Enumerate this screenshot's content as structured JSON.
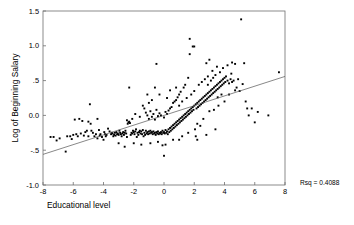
{
  "chart_data": {
    "type": "scatter",
    "title": "",
    "xlabel": "Educational level",
    "ylabel": "Log of Beginning Salary",
    "xlim": [
      -8,
      8
    ],
    "ylim": [
      -1.0,
      1.5
    ],
    "xticks": [
      -8,
      -6,
      -4,
      -2,
      0,
      2,
      4,
      6,
      8
    ],
    "xticklabels": [
      "-8",
      "-6",
      "-4",
      "-2",
      "0",
      "2",
      "4",
      "6",
      "8"
    ],
    "yticks": [
      -1.0,
      -0.5,
      0.0,
      0.5,
      1.0,
      1.5
    ],
    "yticklabels": [
      "-1.0",
      "-.5",
      "0.0",
      ".5",
      "1.0",
      "1.5"
    ],
    "grid": false,
    "legend": null,
    "marker_color": "#000000",
    "marker_size": 1.9,
    "frame_color": "#6f6f6f",
    "annotations": [
      {
        "name": "rsq-annotation",
        "text": "Rsq = 0.4088",
        "x_px": 300,
        "y_px": 185
      }
    ],
    "fit_line": {
      "name": "regression-line",
      "type": "linear",
      "slope": 0.07,
      "intercept": 0.0,
      "x_start": -8,
      "y_start": -0.56,
      "x_end": 8,
      "y_end": 0.56,
      "color": "#555555",
      "width": 0.7
    },
    "points": [
      [
        -7.5,
        -0.31
      ],
      [
        -7.3,
        -0.31
      ],
      [
        -7.1,
        -0.36
      ],
      [
        -6.9,
        -0.33
      ],
      [
        -6.5,
        -0.52
      ],
      [
        -6.4,
        -0.3
      ],
      [
        -6.2,
        -0.3
      ],
      [
        -6.1,
        -0.34
      ],
      [
        -5.9,
        -0.06
      ],
      [
        -5.8,
        -0.27
      ],
      [
        -5.7,
        -0.3
      ],
      [
        -5.6,
        -0.05
      ],
      [
        -5.5,
        -0.26
      ],
      [
        -5.4,
        -0.08
      ],
      [
        -5.3,
        -0.29
      ],
      [
        -5.2,
        -0.24
      ],
      [
        -5.1,
        -0.22
      ],
      [
        -5.0,
        -0.09
      ],
      [
        -4.9,
        0.16
      ],
      [
        -4.85,
        -0.12
      ],
      [
        -4.8,
        -0.22
      ],
      [
        -4.7,
        -0.25
      ],
      [
        -4.6,
        -0.3
      ],
      [
        -4.5,
        -0.27
      ],
      [
        -4.4,
        -0.33
      ],
      [
        -4.3,
        -0.21
      ],
      [
        -4.25,
        -0.29
      ],
      [
        -4.2,
        -0.27
      ],
      [
        -4.1,
        -0.31
      ],
      [
        -4.0,
        -0.35
      ],
      [
        -3.95,
        -0.24
      ],
      [
        -3.9,
        -0.27
      ],
      [
        -3.85,
        -0.3
      ],
      [
        -3.8,
        -0.28
      ],
      [
        -3.7,
        -0.19
      ],
      [
        -3.6,
        -0.23
      ],
      [
        -3.5,
        -0.27
      ],
      [
        -3.45,
        -0.25
      ],
      [
        -3.4,
        -0.26
      ],
      [
        -3.35,
        -0.3
      ],
      [
        -3.3,
        -0.28
      ],
      [
        -3.25,
        -0.25
      ],
      [
        -3.2,
        -0.29
      ],
      [
        -3.15,
        -0.24
      ],
      [
        -3.1,
        -0.27
      ],
      [
        -3.05,
        -0.26
      ],
      [
        -3.0,
        -0.28
      ],
      [
        -2.95,
        -0.22
      ],
      [
        -2.9,
        -0.25
      ],
      [
        -2.85,
        -0.27
      ],
      [
        -2.8,
        -0.3
      ],
      [
        -2.75,
        -0.26
      ],
      [
        -2.7,
        -0.24
      ],
      [
        -2.65,
        -0.28
      ],
      [
        -2.6,
        -0.25
      ],
      [
        -2.55,
        -0.22
      ],
      [
        -2.5,
        -0.26
      ],
      [
        -2.45,
        -0.31
      ],
      [
        -2.4,
        -0.12
      ],
      [
        -2.35,
        -0.1
      ],
      [
        -2.3,
        -0.09
      ],
      [
        -2.25,
        -0.11
      ],
      [
        -2.2,
        -0.28
      ],
      [
        -2.15,
        -0.25
      ],
      [
        -2.1,
        -0.26
      ],
      [
        -2.05,
        -0.22
      ],
      [
        -2.0,
        -0.24
      ],
      [
        -2.0,
        -0.4
      ],
      [
        -1.95,
        -0.27
      ],
      [
        -1.9,
        -0.23
      ],
      [
        -1.85,
        -0.2
      ],
      [
        -1.8,
        -0.31
      ],
      [
        -1.75,
        -0.25
      ],
      [
        -1.7,
        -0.28
      ],
      [
        -1.65,
        -0.24
      ],
      [
        -1.6,
        -0.22
      ],
      [
        -1.55,
        -0.26
      ],
      [
        -1.5,
        -0.23
      ],
      [
        -1.45,
        -0.27
      ],
      [
        -1.4,
        -0.21
      ],
      [
        -1.35,
        -0.3
      ],
      [
        -1.3,
        -0.25
      ],
      [
        -1.3,
        0.1
      ],
      [
        -1.25,
        -0.28
      ],
      [
        -1.2,
        -0.22
      ],
      [
        -1.2,
        0.04
      ],
      [
        -1.15,
        -0.26
      ],
      [
        -1.1,
        -0.24
      ],
      [
        -1.1,
        0.0
      ],
      [
        -1.05,
        -0.27
      ],
      [
        -1.0,
        -0.23
      ],
      [
        -1.0,
        -0.05
      ],
      [
        -1.0,
        0.18
      ],
      [
        -0.95,
        -0.26
      ],
      [
        -0.9,
        -0.22
      ],
      [
        -0.9,
        0.06
      ],
      [
        -0.85,
        -0.25
      ],
      [
        -0.8,
        -0.24
      ],
      [
        -0.8,
        -0.02
      ],
      [
        -0.75,
        -0.27
      ],
      [
        -0.7,
        -0.23
      ],
      [
        -0.7,
        0.02
      ],
      [
        -0.65,
        -0.26
      ],
      [
        -0.6,
        -0.25
      ],
      [
        -0.6,
        -0.06
      ],
      [
        -0.55,
        -0.28
      ],
      [
        -0.5,
        -0.24
      ],
      [
        -0.5,
        0.08
      ],
      [
        -0.45,
        -0.26
      ],
      [
        -0.4,
        -0.23
      ],
      [
        -0.4,
        -0.01
      ],
      [
        -0.35,
        -0.27
      ],
      [
        -0.3,
        -0.25
      ],
      [
        -0.3,
        0.03
      ],
      [
        -0.25,
        -0.26
      ],
      [
        -0.2,
        -0.24
      ],
      [
        -0.2,
        0.0
      ],
      [
        -0.15,
        -0.27
      ],
      [
        -0.1,
        -0.22
      ],
      [
        -0.1,
        -0.43
      ],
      [
        -0.05,
        -0.25
      ],
      [
        0.0,
        -0.24
      ],
      [
        0.0,
        -0.03
      ],
      [
        0.0,
        -0.58
      ],
      [
        0.05,
        -0.26
      ],
      [
        0.1,
        -0.21
      ],
      [
        0.1,
        0.05
      ],
      [
        0.15,
        -0.25
      ],
      [
        0.2,
        -0.23
      ],
      [
        0.2,
        0.02
      ],
      [
        0.25,
        -0.27
      ],
      [
        0.3,
        -0.2
      ],
      [
        0.3,
        0.07
      ],
      [
        0.35,
        -0.24
      ],
      [
        0.4,
        -0.18
      ],
      [
        0.4,
        0.1
      ],
      [
        0.45,
        -0.22
      ],
      [
        0.5,
        -0.16
      ],
      [
        0.5,
        0.12
      ],
      [
        0.55,
        -0.2
      ],
      [
        0.6,
        -0.14
      ],
      [
        0.6,
        0.18
      ],
      [
        0.65,
        -0.18
      ],
      [
        0.7,
        -0.12
      ],
      [
        0.7,
        0.2
      ],
      [
        0.75,
        -0.16
      ],
      [
        0.8,
        -0.1
      ],
      [
        0.8,
        0.22
      ],
      [
        0.85,
        -0.14
      ],
      [
        0.9,
        -0.08
      ],
      [
        0.9,
        0.26
      ],
      [
        0.95,
        -0.12
      ],
      [
        1.0,
        -0.06
      ],
      [
        1.0,
        0.14
      ],
      [
        1.0,
        0.3
      ],
      [
        1.05,
        -0.1
      ],
      [
        1.1,
        -0.04
      ],
      [
        1.1,
        0.34
      ],
      [
        1.15,
        -0.08
      ],
      [
        1.2,
        -0.02
      ],
      [
        1.2,
        0.2
      ],
      [
        1.25,
        -0.06
      ],
      [
        1.3,
        0.0
      ],
      [
        1.3,
        0.4
      ],
      [
        1.35,
        -0.04
      ],
      [
        1.4,
        0.02
      ],
      [
        1.4,
        0.44
      ],
      [
        1.45,
        -0.02
      ],
      [
        1.5,
        0.04
      ],
      [
        1.5,
        0.25
      ],
      [
        1.55,
        0.0
      ],
      [
        1.6,
        0.06
      ],
      [
        1.6,
        0.54
      ],
      [
        1.65,
        0.02
      ],
      [
        1.7,
        0.08
      ],
      [
        1.7,
        0.88
      ],
      [
        1.7,
        1.1
      ],
      [
        1.75,
        0.04
      ],
      [
        1.8,
        0.1
      ],
      [
        1.8,
        0.3
      ],
      [
        1.85,
        0.06
      ],
      [
        1.9,
        0.12
      ],
      [
        1.9,
        0.99
      ],
      [
        1.95,
        0.08
      ],
      [
        2.0,
        0.14
      ],
      [
        2.0,
        0.35
      ],
      [
        2.0,
        0.99
      ],
      [
        2.05,
        -0.2
      ],
      [
        2.1,
        0.16
      ],
      [
        2.1,
        -0.3
      ],
      [
        2.15,
        0.1
      ],
      [
        2.2,
        0.18
      ],
      [
        2.2,
        -0.12
      ],
      [
        2.25,
        0.12
      ],
      [
        2.3,
        0.2
      ],
      [
        2.3,
        0.44
      ],
      [
        2.35,
        0.14
      ],
      [
        2.4,
        0.22
      ],
      [
        2.4,
        -0.15
      ],
      [
        2.45,
        0.16
      ],
      [
        2.5,
        0.24
      ],
      [
        2.5,
        0.48
      ],
      [
        2.55,
        0.18
      ],
      [
        2.6,
        0.26
      ],
      [
        2.6,
        -0.05
      ],
      [
        2.65,
        0.2
      ],
      [
        2.7,
        0.28
      ],
      [
        2.7,
        0.52
      ],
      [
        2.75,
        0.22
      ],
      [
        2.8,
        0.3
      ],
      [
        2.8,
        0.75
      ],
      [
        2.85,
        0.24
      ],
      [
        2.9,
        0.32
      ],
      [
        2.9,
        0.56
      ],
      [
        2.95,
        0.26
      ],
      [
        3.0,
        0.34
      ],
      [
        3.0,
        0.06
      ],
      [
        3.0,
        0.8
      ],
      [
        3.05,
        0.28
      ],
      [
        3.1,
        0.36
      ],
      [
        3.1,
        0.5
      ],
      [
        3.15,
        0.3
      ],
      [
        3.2,
        0.38
      ],
      [
        3.2,
        0.64
      ],
      [
        3.25,
        0.32
      ],
      [
        3.3,
        0.4
      ],
      [
        3.3,
        0.08
      ],
      [
        3.35,
        0.34
      ],
      [
        3.4,
        0.42
      ],
      [
        3.4,
        0.58
      ],
      [
        3.45,
        0.36
      ],
      [
        3.5,
        0.44
      ],
      [
        3.5,
        0.7
      ],
      [
        3.55,
        0.38
      ],
      [
        3.6,
        0.46
      ],
      [
        3.6,
        0.14
      ],
      [
        3.65,
        0.4
      ],
      [
        3.7,
        0.48
      ],
      [
        3.7,
        0.62
      ],
      [
        3.75,
        0.42
      ],
      [
        3.8,
        0.5
      ],
      [
        3.8,
        0.3
      ],
      [
        3.85,
        0.44
      ],
      [
        3.9,
        0.52
      ],
      [
        3.9,
        0.68
      ],
      [
        3.95,
        0.46
      ],
      [
        4.0,
        0.54
      ],
      [
        4.0,
        0.2
      ],
      [
        4.05,
        0.48
      ],
      [
        4.1,
        0.56
      ],
      [
        4.2,
        0.5
      ],
      [
        4.2,
        0.72
      ],
      [
        4.3,
        0.46
      ],
      [
        4.3,
        0.3
      ],
      [
        4.4,
        0.52
      ],
      [
        4.5,
        0.48
      ],
      [
        4.5,
        0.76
      ],
      [
        4.6,
        0.5
      ],
      [
        4.7,
        0.36
      ],
      [
        4.7,
        0.74
      ],
      [
        4.8,
        0.4
      ],
      [
        4.9,
        0.52
      ],
      [
        5.0,
        0.35
      ],
      [
        5.1,
        1.38
      ],
      [
        5.2,
        0.45
      ],
      [
        5.3,
        0.75
      ],
      [
        5.4,
        0.2
      ],
      [
        5.5,
        0.1
      ],
      [
        5.6,
        0.0
      ],
      [
        5.8,
        0.1
      ],
      [
        6.0,
        -0.1
      ],
      [
        6.2,
        0.05
      ],
      [
        6.9,
        0.0
      ],
      [
        7.6,
        0.62
      ],
      [
        -2.3,
        0.4
      ],
      [
        -0.5,
        0.74
      ],
      [
        -1.5,
        -0.42
      ],
      [
        -2.6,
        -0.45
      ],
      [
        -3.0,
        -0.4
      ],
      [
        0.6,
        -0.35
      ],
      [
        1.2,
        -0.3
      ],
      [
        2.2,
        -0.35
      ],
      [
        2.8,
        -0.28
      ],
      [
        3.4,
        -0.2
      ],
      [
        -4.4,
        -0.05
      ],
      [
        -5.0,
        -0.3
      ],
      [
        -6.0,
        -0.28
      ],
      [
        -0.3,
        0.3
      ],
      [
        0.4,
        0.36
      ],
      [
        -0.8,
        0.22
      ],
      [
        -1.4,
        0.14
      ],
      [
        0.8,
        0.4
      ],
      [
        1.0,
        -0.35
      ],
      [
        1.6,
        -0.25
      ],
      [
        -2.1,
        -0.05
      ],
      [
        -2.45,
        -0.07
      ],
      [
        -1.9,
        0.02
      ],
      [
        -1.6,
        -0.02
      ],
      [
        -0.6,
        0.4
      ],
      [
        0.2,
        0.25
      ],
      [
        -1.1,
        0.3
      ],
      [
        -0.9,
        -0.4
      ],
      [
        -0.4,
        -0.38
      ],
      [
        0.1,
        -0.42
      ],
      [
        2.9,
        0.44
      ],
      [
        3.25,
        0.54
      ],
      [
        3.55,
        0.26
      ],
      [
        4.45,
        0.6
      ]
    ]
  },
  "axis": {
    "x_title": "Educational level",
    "y_title": "Log of Beginning Salary"
  }
}
